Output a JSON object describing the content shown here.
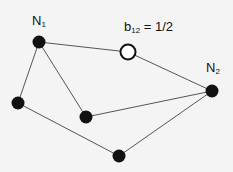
{
  "colors": {
    "edge": "#555555",
    "node_fill": "#111111",
    "open_node_stroke": "#111111",
    "background": "#f4f4f4"
  },
  "labels": {
    "n1": {
      "base": "N",
      "sub": "1"
    },
    "n2": {
      "base": "N",
      "sub": "2"
    },
    "b12": {
      "base": "b",
      "sub": "12",
      "rest": " = 1/2"
    }
  },
  "nodes": [
    {
      "id": "n1",
      "x": 39,
      "y": 42,
      "type": "filled"
    },
    {
      "id": "b12",
      "x": 128,
      "y": 52,
      "type": "open"
    },
    {
      "id": "n2",
      "x": 212,
      "y": 91,
      "type": "filled"
    },
    {
      "id": "left",
      "x": 18,
      "y": 103,
      "type": "filled"
    },
    {
      "id": "middle",
      "x": 86,
      "y": 117,
      "type": "filled"
    },
    {
      "id": "bottom",
      "x": 119,
      "y": 156,
      "type": "filled"
    }
  ],
  "edges": [
    [
      "n1",
      "b12"
    ],
    [
      "b12",
      "n2"
    ],
    [
      "n1",
      "left"
    ],
    [
      "n1",
      "middle"
    ],
    [
      "middle",
      "n2"
    ],
    [
      "left",
      "bottom"
    ],
    [
      "bottom",
      "n2"
    ]
  ]
}
